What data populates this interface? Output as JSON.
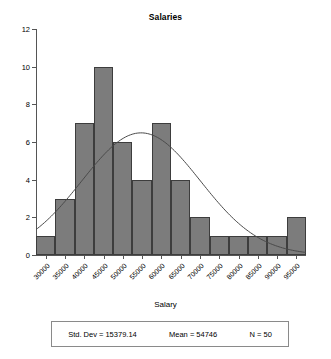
{
  "chart_data": {
    "type": "bar",
    "title": "Salaries",
    "xlabel": "Salary",
    "ylabel": "",
    "grid": false,
    "legend": "none",
    "xlim": [
      27500,
      97500
    ],
    "ylim": [
      0,
      12
    ],
    "bin_width": 5000,
    "bin_starts": [
      27500,
      32500,
      37500,
      42500,
      47500,
      52500,
      57500,
      62500,
      67500,
      72500,
      77500,
      82500,
      87500,
      92500
    ],
    "categories": [
      "30000",
      "35000",
      "40000",
      "45000",
      "50000",
      "55000",
      "60000",
      "65000",
      "70000",
      "75000",
      "80000",
      "85000",
      "90000",
      "95000"
    ],
    "values": [
      1,
      3,
      7,
      10,
      6,
      4,
      7,
      4,
      2,
      1,
      1,
      1,
      1,
      2
    ],
    "x_tick_labels": [
      "30000",
      "35000",
      "40000",
      "45000",
      "50000",
      "55000",
      "60000",
      "65000",
      "70000",
      "75000",
      "80000",
      "85000",
      "90000",
      "95000"
    ],
    "y_tick_labels": [
      "0",
      "2",
      "4",
      "6",
      "8",
      "10",
      "12"
    ],
    "y_ticks": [
      0,
      2,
      4,
      6,
      8,
      10,
      12
    ],
    "normal_curve": {
      "mean": 54746,
      "std_dev": 15379.14,
      "n": 50,
      "peak_value": 6.48
    },
    "colors": {
      "bar_fill": "#7c7c7c",
      "bar_edge": "#3d3d3d",
      "curve": "#4a4a4a",
      "axis": "#555555",
      "text": "#000000",
      "background": "#ffffff"
    }
  },
  "stats": {
    "std_dev": "Std. Dev = 15379.14",
    "mean": "Mean = 54746",
    "n": "N = 50"
  }
}
